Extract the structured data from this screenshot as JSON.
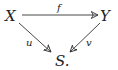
{
  "diagram": {
    "type": "commutative-diagram",
    "nodes": {
      "x": {
        "label": "X"
      },
      "y": {
        "label": "Y"
      },
      "s": {
        "label": "S."
      }
    },
    "arrows": {
      "f": {
        "from": "X",
        "to": "Y",
        "label": "f"
      },
      "u": {
        "from": "X",
        "to": "S",
        "label": "u"
      },
      "v": {
        "from": "Y",
        "to": "S",
        "label": "v"
      }
    },
    "colors": {
      "ink": "#222222",
      "background": "#ffffff"
    }
  }
}
